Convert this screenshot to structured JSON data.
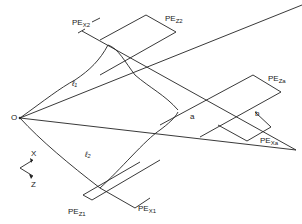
{
  "diagram": {
    "type": "beam-geometry-schematic",
    "stroke_color": "#222222",
    "background": "#ffffff",
    "labels": {
      "origin": "O",
      "axis_x": "X",
      "axis_z": "Z",
      "ell_1": "ℓ₁",
      "ell_2": "ℓ₂",
      "point_a": "a",
      "point_b": "b",
      "pe_x2": {
        "base": "PE",
        "sub": "X2"
      },
      "pe_z2": {
        "base": "PE",
        "sub": "Z2"
      },
      "pe_za": {
        "base": "PE",
        "sub": "Za"
      },
      "pe_xa": {
        "base": "PE",
        "sub": "Xa"
      },
      "pe_z1": {
        "base": "PE",
        "sub": "Z1"
      },
      "pe_x1": {
        "base": "PE",
        "sub": "X1"
      }
    }
  }
}
